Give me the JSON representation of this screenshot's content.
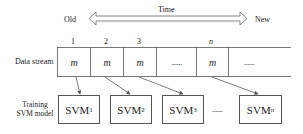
{
  "time_axis": {
    "label": "Time",
    "left_label": "Old",
    "right_label": "New"
  },
  "data_stream": {
    "row_label": "Data stream",
    "indices": [
      "1",
      "2",
      "3",
      "n"
    ],
    "cells": [
      "m",
      "m",
      "m",
      "......",
      "m",
      "......"
    ]
  },
  "models": {
    "row_label_line1": "Training",
    "row_label_line2": "SVM model",
    "boxes": [
      {
        "base": "SVM",
        "sub": "1"
      },
      {
        "base": "SVM",
        "sub": "2"
      },
      {
        "base": "SVM",
        "sub": "3"
      },
      {
        "base": "SVM",
        "sub": "n"
      }
    ],
    "ellipsis": "......"
  },
  "colors": {
    "line": "#555555",
    "text": "#222222",
    "background": "#ffffff"
  }
}
